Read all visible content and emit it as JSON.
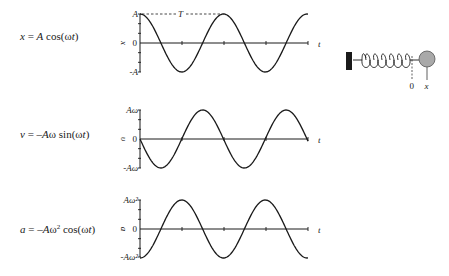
{
  "formulas": {
    "x": {
      "lhs": "x",
      "eq": " = ",
      "coef": "A",
      "func": " cos(ω",
      "var": "t",
      "close": ")"
    },
    "v": {
      "lhs": "v",
      "eq": " = –",
      "coef": "A",
      "omega": "ω",
      "func": " sin(ω",
      "var": "t",
      "close": ")"
    },
    "a": {
      "lhs": "a",
      "eq": " = –",
      "coef": "A",
      "omega": "ω",
      "exp": "2",
      "func": " cos(ω",
      "var": "t",
      "close": ")"
    }
  },
  "graphs": [
    {
      "name": "position",
      "ylabel": "x",
      "top_label": "A",
      "zero_label": "0",
      "bottom_label": "-A",
      "xlabel": "t",
      "period_label": "T",
      "function": "cos",
      "sign": 1
    },
    {
      "name": "velocity",
      "ylabel": "υ",
      "top_label": "Aω",
      "zero_label": "0",
      "bottom_label": "-Aω",
      "xlabel": "t",
      "function": "sin",
      "sign": -1
    },
    {
      "name": "acceleration",
      "ylabel": "a",
      "top_label": "Aω²",
      "zero_label": "0",
      "bottom_label": "-Aω²",
      "xlabel": "t",
      "function": "cos",
      "sign": -1
    }
  ],
  "spring_diagram": {
    "equilibrium_label": "0",
    "position_label": "x",
    "ball_color": "#a9a9a9",
    "wall_color": "#1a1a1a"
  },
  "chart_data": [
    {
      "type": "line",
      "title": "x = A cos(ωt)",
      "xlabel": "t",
      "ylabel": "x",
      "yticks": [
        "-A",
        "0",
        "A"
      ],
      "period_annotation": "T",
      "x_range_periods": 2,
      "series": [
        {
          "name": "x(t)",
          "expr": "A cos(ωt)"
        }
      ]
    },
    {
      "type": "line",
      "title": "v = -Aω sin(ωt)",
      "xlabel": "t",
      "ylabel": "υ",
      "yticks": [
        "-Aω",
        "0",
        "Aω"
      ],
      "x_range_periods": 2,
      "series": [
        {
          "name": "v(t)",
          "expr": "-Aω sin(ωt)"
        }
      ]
    },
    {
      "type": "line",
      "title": "a = -Aω² cos(ωt)",
      "xlabel": "t",
      "ylabel": "a",
      "yticks": [
        "-Aω²",
        "0",
        "Aω²"
      ],
      "x_range_periods": 2,
      "series": [
        {
          "name": "a(t)",
          "expr": "-Aω² cos(ωt)"
        }
      ]
    }
  ]
}
